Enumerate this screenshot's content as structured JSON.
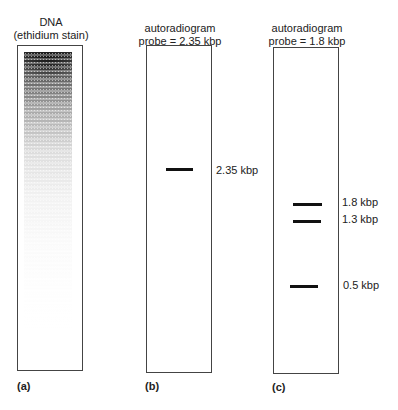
{
  "panels": [
    {
      "id": "a",
      "title_line1": "DNA",
      "title_line2": "(ethidium stain)",
      "label": "(a)",
      "type": "smear",
      "bands": []
    },
    {
      "id": "b",
      "title_line1": "autoradiogram",
      "title_line2": "probe = 2.35 kbp",
      "label": "(b)",
      "type": "bands",
      "bands": [
        {
          "label": "2.35 kbp"
        }
      ]
    },
    {
      "id": "c",
      "title_line1": "autoradiogram",
      "title_line2": "probe = 1.8 kbp",
      "label": "(c)",
      "type": "bands",
      "bands": [
        {
          "label": "1.8 kbp"
        },
        {
          "label": "1.3 kbp"
        },
        {
          "label": "0.5 kbp"
        }
      ]
    }
  ],
  "colors": {
    "border": "#444444",
    "band": "#111111",
    "text": "#222222"
  }
}
